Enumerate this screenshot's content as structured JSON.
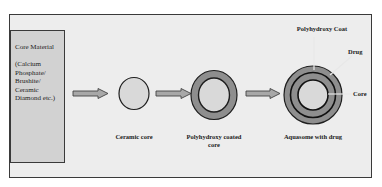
{
  "diagram": {
    "core_material": {
      "title": "Core Material",
      "examples_lines": [
        "(Calcium",
        "Phosphate/",
        "Brushite/",
        "Ceramic",
        "Diamond etc.)"
      ]
    },
    "stages": [
      {
        "id": "ceramic-core",
        "label": "Ceramic core"
      },
      {
        "id": "polyhydroxy-coated-core",
        "label_line1": "Polyhydroxy coated",
        "label_line2": "core"
      },
      {
        "id": "aquasome-with-drug",
        "label": "Aquasome with drug"
      }
    ],
    "aquasome_parts": {
      "coat": "Polyhydroxy Coat",
      "drug": "Drug",
      "core": "Core"
    },
    "colors": {
      "frame_fill": "#ededed",
      "core_box_fill": "#d2d2d2",
      "core_fill": "#d9d9d9",
      "coat_fill": "#8e8e8e",
      "outline": "#1e1e1e",
      "arrow_fill": "#a8a8a8"
    }
  }
}
